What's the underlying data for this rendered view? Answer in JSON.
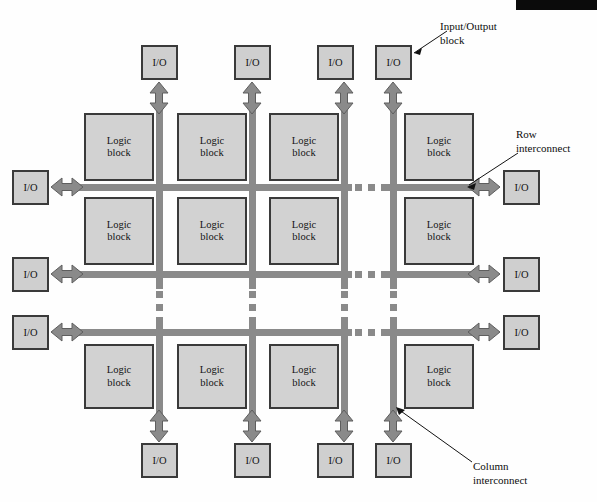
{
  "figure": {
    "type": "fpga-architecture-diagram",
    "artifact_bar": {
      "present": true,
      "color": "#0b0b0b"
    },
    "colors": {
      "logic_block_fill": "#d2d2d2",
      "io_block_fill": "#cfcfcf",
      "block_border": "#3a3a3a",
      "interconnect": "#8a8a8a",
      "arrow": "#8a8a8a",
      "arrow_border": "#5e5e5e",
      "text": "#141414"
    }
  },
  "labels": {
    "logic_block_line1": "Logic",
    "logic_block_line2": "block",
    "io_block": "I/O"
  },
  "callouts": [
    {
      "id": "input-output-block",
      "line1": "Input/Output",
      "line2": "block"
    },
    {
      "id": "row-interconnect",
      "line1": "Row",
      "line2": "interconnect"
    },
    {
      "id": "column-interconnect",
      "line1": "Column",
      "line2": "interconnect"
    }
  ],
  "logic_blocks": [
    {
      "id": "lb-r1c1",
      "row": 1,
      "col": 1,
      "x": 84,
      "y": 113,
      "w": 70,
      "h": 68
    },
    {
      "id": "lb-r1c2",
      "row": 1,
      "col": 2,
      "x": 177,
      "y": 113,
      "w": 70,
      "h": 68
    },
    {
      "id": "lb-r1c3",
      "row": 1,
      "col": 3,
      "x": 269,
      "y": 113,
      "w": 70,
      "h": 68
    },
    {
      "id": "lb-r1c4",
      "row": 1,
      "col": 4,
      "x": 404,
      "y": 113,
      "w": 70,
      "h": 68
    },
    {
      "id": "lb-r2c1",
      "row": 2,
      "col": 1,
      "x": 84,
      "y": 197,
      "w": 70,
      "h": 68
    },
    {
      "id": "lb-r2c2",
      "row": 2,
      "col": 2,
      "x": 177,
      "y": 197,
      "w": 70,
      "h": 68
    },
    {
      "id": "lb-r2c3",
      "row": 2,
      "col": 3,
      "x": 269,
      "y": 197,
      "w": 70,
      "h": 68
    },
    {
      "id": "lb-r2c4",
      "row": 2,
      "col": 4,
      "x": 404,
      "y": 197,
      "w": 70,
      "h": 68
    },
    {
      "id": "lb-r3c1",
      "row": 3,
      "col": 1,
      "x": 84,
      "y": 344,
      "w": 70,
      "h": 65
    },
    {
      "id": "lb-r3c2",
      "row": 3,
      "col": 2,
      "x": 177,
      "y": 344,
      "w": 70,
      "h": 65
    },
    {
      "id": "lb-r3c3",
      "row": 3,
      "col": 3,
      "x": 269,
      "y": 344,
      "w": 70,
      "h": 65
    },
    {
      "id": "lb-r3c4",
      "row": 3,
      "col": 4,
      "x": 404,
      "y": 344,
      "w": 70,
      "h": 65
    }
  ],
  "io_blocks": [
    {
      "id": "io-top-1",
      "side": "top",
      "x": 141,
      "y": 45,
      "w": 37,
      "h": 35
    },
    {
      "id": "io-top-2",
      "side": "top",
      "x": 234,
      "y": 45,
      "w": 37,
      "h": 35
    },
    {
      "id": "io-top-3",
      "side": "top",
      "x": 317,
      "y": 45,
      "w": 37,
      "h": 35
    },
    {
      "id": "io-top-4",
      "side": "top",
      "x": 375,
      "y": 45,
      "w": 37,
      "h": 35
    },
    {
      "id": "io-left-1",
      "side": "left",
      "x": 12,
      "y": 170,
      "w": 37,
      "h": 35
    },
    {
      "id": "io-left-2",
      "side": "left",
      "x": 12,
      "y": 257,
      "w": 37,
      "h": 35
    },
    {
      "id": "io-left-3",
      "side": "left",
      "x": 12,
      "y": 315,
      "w": 37,
      "h": 35
    },
    {
      "id": "io-right-1",
      "side": "right",
      "x": 503,
      "y": 170,
      "w": 37,
      "h": 35
    },
    {
      "id": "io-right-2",
      "side": "right",
      "x": 503,
      "y": 257,
      "w": 37,
      "h": 35
    },
    {
      "id": "io-right-3",
      "side": "right",
      "x": 503,
      "y": 315,
      "w": 37,
      "h": 35
    },
    {
      "id": "io-bottom-1",
      "side": "bottom",
      "x": 141,
      "y": 443,
      "w": 37,
      "h": 35
    },
    {
      "id": "io-bottom-2",
      "side": "bottom",
      "x": 234,
      "y": 443,
      "w": 37,
      "h": 35
    },
    {
      "id": "io-bottom-3",
      "side": "bottom",
      "x": 317,
      "y": 443,
      "w": 37,
      "h": 35
    },
    {
      "id": "io-bottom-4",
      "side": "bottom",
      "x": 375,
      "y": 443,
      "w": 37,
      "h": 35
    }
  ],
  "row_interconnects": [
    {
      "id": "row-bus-1",
      "y": 184
    },
    {
      "id": "row-bus-2",
      "y": 271
    },
    {
      "id": "row-bus-3",
      "y": 329
    }
  ],
  "column_interconnects": [
    {
      "id": "col-bus-1",
      "x": 156
    },
    {
      "id": "col-bus-2",
      "x": 249
    },
    {
      "id": "col-bus-3",
      "x": 341
    },
    {
      "id": "col-bus-4",
      "x": 390
    }
  ]
}
